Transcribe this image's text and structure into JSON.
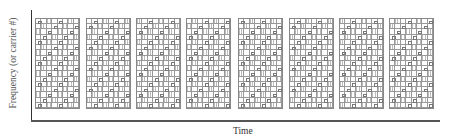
{
  "diagram": {
    "y_axis_label": "Frequency (or carrier #)",
    "x_axis_label": "Time",
    "blocks": [
      {
        "x": 35
      },
      {
        "x": 86
      },
      {
        "x": 136
      },
      {
        "x": 186
      },
      {
        "x": 238
      },
      {
        "x": 289
      },
      {
        "x": 339
      },
      {
        "x": 389
      }
    ],
    "grid": {
      "columns": 8,
      "rows": 17
    },
    "colors": {
      "axis": "#333333",
      "grid": "#999999"
    }
  }
}
